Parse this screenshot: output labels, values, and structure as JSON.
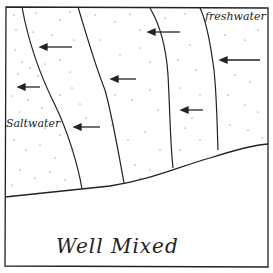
{
  "diagram": {
    "title": "Well Mixed",
    "labels": {
      "freshwater": "freshwater",
      "saltwater": "Saltwater"
    },
    "arrows_direction": "left",
    "arrow_count": 7,
    "isohaline_line_count": 4,
    "colors": {
      "ink": "#222222",
      "background": "#ffffff"
    }
  }
}
